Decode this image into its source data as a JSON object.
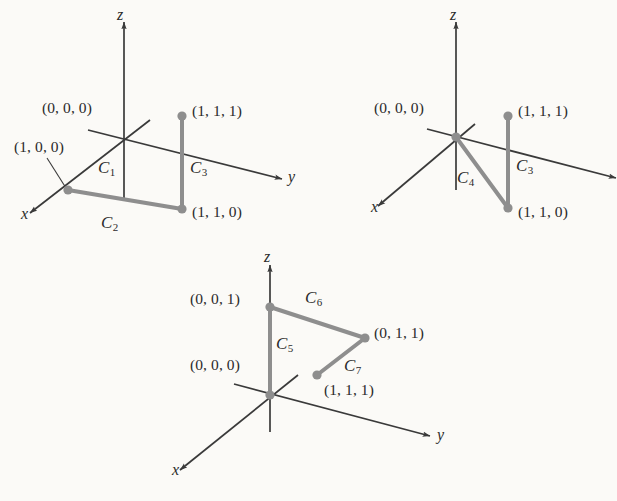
{
  "figure": {
    "type": "math-diagram",
    "background_color": "#fbfaf7",
    "axis_color": "#3a3a3a",
    "curve_color": "#8e8e8e",
    "point_color": "#8e8e8e",
    "text_color": "#2b2b2b"
  },
  "diagrams": [
    {
      "id": "diagram-1",
      "axes": [
        {
          "name": "z",
          "label": "z"
        },
        {
          "name": "y",
          "label": "y"
        },
        {
          "name": "x",
          "label": "x"
        }
      ],
      "points": [
        {
          "name": "origin",
          "label": "(0, 0, 0)"
        },
        {
          "name": "p-100",
          "label": "(1, 0, 0)"
        },
        {
          "name": "p-111",
          "label": "(1, 1, 1)"
        },
        {
          "name": "p-110",
          "label": "(1, 1, 0)"
        }
      ],
      "curves": [
        {
          "name": "C1",
          "base": "C",
          "sub": "1",
          "from": "(0, 0, 0)",
          "to": "(1, 0, 0)"
        },
        {
          "name": "C2",
          "base": "C",
          "sub": "2",
          "from": "(1, 0, 0)",
          "to": "(1, 1, 0)"
        },
        {
          "name": "C3",
          "base": "C",
          "sub": "3",
          "from": "(1, 1, 0)",
          "to": "(1, 1, 1)"
        }
      ]
    },
    {
      "id": "diagram-2",
      "axes": [
        {
          "name": "z",
          "label": "z"
        },
        {
          "name": "y",
          "label": ""
        },
        {
          "name": "x",
          "label": "x"
        }
      ],
      "points": [
        {
          "name": "origin",
          "label": "(0, 0, 0)"
        },
        {
          "name": "p-111",
          "label": "(1, 1, 1)"
        },
        {
          "name": "p-110",
          "label": "(1, 1, 0)"
        }
      ],
      "curves": [
        {
          "name": "C4",
          "base": "C",
          "sub": "4",
          "from": "(0, 0, 0)",
          "to": "(1, 1, 0)"
        },
        {
          "name": "C3",
          "base": "C",
          "sub": "3",
          "from": "(1, 1, 0)",
          "to": "(1, 1, 1)"
        }
      ]
    },
    {
      "id": "diagram-3",
      "axes": [
        {
          "name": "z",
          "label": "z"
        },
        {
          "name": "y",
          "label": "y"
        },
        {
          "name": "x",
          "label": "x"
        }
      ],
      "points": [
        {
          "name": "p-001",
          "label": "(0, 0, 1)"
        },
        {
          "name": "origin",
          "label": "(0, 0, 0)"
        },
        {
          "name": "p-011",
          "label": "(0, 1, 1)"
        },
        {
          "name": "p-111",
          "label": "(1, 1, 1)"
        }
      ],
      "curves": [
        {
          "name": "C5",
          "base": "C",
          "sub": "5",
          "from": "(0, 0, 0)",
          "to": "(0, 0, 1)"
        },
        {
          "name": "C6",
          "base": "C",
          "sub": "6",
          "from": "(0, 0, 1)",
          "to": "(0, 1, 1)"
        },
        {
          "name": "C7",
          "base": "C",
          "sub": "7",
          "from": "(0, 1, 1)",
          "to": "(1, 1, 1)"
        }
      ]
    }
  ]
}
